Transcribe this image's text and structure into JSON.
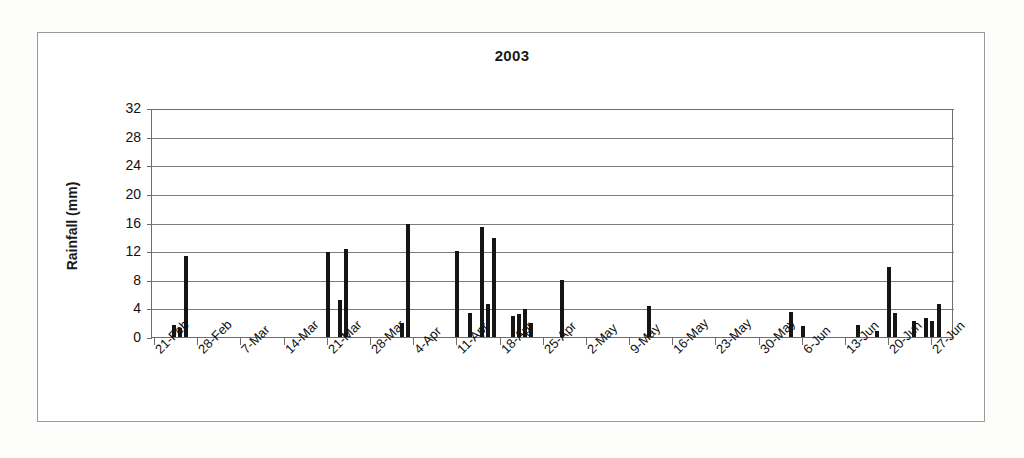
{
  "chart_data": {
    "type": "bar",
    "title": "2003",
    "xlabel": "",
    "ylabel": "Rainfall (mm)",
    "ylim": [
      0,
      32
    ],
    "ytick_values": [
      0,
      4,
      8,
      12,
      16,
      20,
      24,
      28,
      32
    ],
    "ytick_labels": [
      "0",
      "4",
      "8",
      "12",
      "16",
      "20",
      "24",
      "28",
      "32"
    ],
    "grid": true,
    "legend": false,
    "x_axis_start_date": "21-Feb",
    "x_axis_end_date": "27-Jun",
    "xtick_labels": [
      "21-Feb",
      "28-Feb",
      "7-Mar",
      "14-Mar",
      "21-Mar",
      "28-Mar",
      "4-Apr",
      "11-Apr",
      "18-Apr",
      "25-Apr",
      "2-May",
      "9-May",
      "16-May",
      "23-May",
      "30-May",
      "6-Jun",
      "13-Jun",
      "20-Jun",
      "27-Jun"
    ],
    "xtick_day_indices": [
      0,
      7,
      14,
      21,
      28,
      35,
      42,
      49,
      56,
      63,
      70,
      77,
      84,
      91,
      98,
      105,
      112,
      119,
      126
    ],
    "n_days": 130,
    "bar_color": "#151515",
    "values": [
      0,
      0,
      0,
      1.7,
      1.2,
      11.3,
      0,
      0,
      0,
      0,
      0,
      0,
      0,
      0,
      0,
      0,
      0,
      0,
      0,
      0,
      0,
      0,
      0,
      0,
      0,
      0,
      0,
      0,
      11.9,
      0,
      5.2,
      12.3,
      0,
      0,
      0,
      0,
      0,
      0,
      0,
      0,
      2.0,
      15.8,
      0,
      0,
      0,
      0,
      0,
      0,
      0,
      12.0,
      0,
      3.4,
      0,
      15.4,
      4.6,
      13.8,
      0,
      0,
      2.9,
      3.2,
      3.9,
      1.9,
      0,
      0,
      0,
      0,
      7.9,
      0,
      0,
      0,
      0,
      0,
      0,
      0,
      0,
      0,
      0,
      0,
      0,
      0,
      4.3,
      0,
      0,
      0,
      0,
      0,
      0,
      0,
      0,
      0,
      0,
      0,
      0,
      0,
      0,
      0,
      0,
      0,
      0,
      0,
      0,
      0,
      0,
      3.5,
      0,
      1.6,
      0,
      0,
      0,
      0,
      0,
      0,
      0,
      0,
      1.7,
      0,
      0,
      0.9,
      0,
      9.8,
      3.3,
      0,
      0,
      2.2,
      0,
      2.6,
      2.2,
      4.6,
      0,
      0,
      0,
      0,
      0,
      0,
      0
    ]
  }
}
